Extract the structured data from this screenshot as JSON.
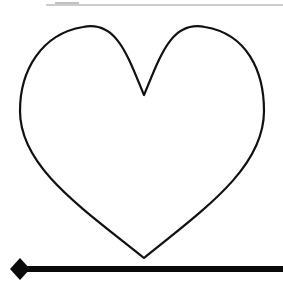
{
  "canvas": {
    "width": 283,
    "height": 289,
    "background_color": "#ffffff",
    "title": "Heart shape with horizontal rules"
  },
  "top_rule": {
    "name": "Top horizontal rule",
    "color": "#9a9a9a",
    "thickness": 1,
    "x_start": 46,
    "x_end": 283,
    "y": 5,
    "smudge": {
      "name": "Faint gray mark",
      "color": "#8f8f8f",
      "x_start": 55,
      "x_end": 79,
      "y": 3,
      "thickness": 2
    }
  },
  "heart": {
    "name": "Heart outline",
    "stroke_color": "#111111",
    "fill_color": "none",
    "stroke_width": 2.2,
    "bounds": {
      "left": 20,
      "top": 27,
      "right": 264,
      "bottom": 258
    },
    "notch": {
      "x": 144,
      "y": 95
    },
    "tip": {
      "x": 144,
      "y": 258
    },
    "left_lobe_peak": {
      "x": 83,
      "y": 27
    },
    "right_lobe_peak": {
      "x": 205,
      "y": 27
    },
    "left_widest": {
      "x": 20,
      "y": 105
    },
    "right_widest": {
      "x": 264,
      "y": 105
    }
  },
  "bottom_arrow": {
    "name": "Bottom arrow line",
    "color": "#0a0a0a",
    "thickness": 6,
    "y": 269,
    "x_start": 20,
    "x_end": 283,
    "head": {
      "name": "Diamond arrowhead",
      "shape": "diamond",
      "center_x": 20,
      "center_y": 269,
      "half_width": 10,
      "half_height": 11,
      "color": "#0a0a0a",
      "position": "left"
    }
  },
  "accessibility": {
    "figure_description": "A large outlined heart centered on a white page, a thin gray rule across the top, and a thick black line with a diamond arrowhead along the bottom."
  }
}
